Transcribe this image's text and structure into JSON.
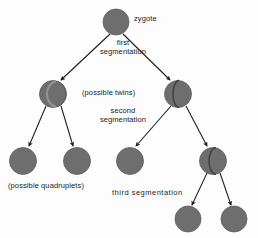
{
  "diagram": {
    "colors": {
      "cell_fill": "#6e6e6e",
      "cell_stroke": "#5a5a5a",
      "cell_cleft_light": "#8d8d8d",
      "cell_cleft_dark": "#4a4a4a",
      "arrow": "#1a1a1a",
      "text": "#1a1a1a",
      "background": "#fdfdfd"
    },
    "labels": {
      "zygote": "zygote",
      "first_segmentation": "first\nsegmentation",
      "first_segmentation_line1": "first",
      "first_segmentation_line2": "segmentation",
      "possible_twins": "(possible twins)",
      "second_segmentation_line1": "second",
      "second_segmentation_line2": "segmentation",
      "possible_quadruplets": "(possible quadruplets)",
      "third_segmentation": "third segmentation"
    },
    "nodes": [
      {
        "id": "zygote",
        "cx": 116,
        "cy": 22,
        "r": 13,
        "split": "none",
        "generation": 0
      },
      {
        "id": "twin-l",
        "cx": 53,
        "cy": 94,
        "r": 13.5,
        "split": "light",
        "generation": 1
      },
      {
        "id": "twin-r",
        "cx": 178,
        "cy": 94,
        "r": 13.5,
        "split": "dark",
        "generation": 1
      },
      {
        "id": "quad-1",
        "cx": 23,
        "cy": 161,
        "r": 13.5,
        "split": "none",
        "generation": 2
      },
      {
        "id": "quad-2",
        "cx": 77,
        "cy": 161,
        "r": 13.5,
        "split": "none",
        "generation": 2
      },
      {
        "id": "quad-3",
        "cx": 130,
        "cy": 161,
        "r": 13.5,
        "split": "none",
        "generation": 2
      },
      {
        "id": "quad-4",
        "cx": 213,
        "cy": 161,
        "r": 13.5,
        "split": "dark",
        "generation": 2
      },
      {
        "id": "oct-1",
        "cx": 188,
        "cy": 219,
        "r": 13,
        "split": "none",
        "generation": 3
      },
      {
        "id": "oct-2",
        "cx": 234,
        "cy": 219,
        "r": 13,
        "split": "none",
        "generation": 3
      }
    ],
    "edges": [
      {
        "from": "zygote",
        "to": "twin-l"
      },
      {
        "from": "zygote",
        "to": "twin-r"
      },
      {
        "from": "twin-l",
        "to": "quad-1"
      },
      {
        "from": "twin-l",
        "to": "quad-2"
      },
      {
        "from": "twin-r",
        "to": "quad-3"
      },
      {
        "from": "twin-r",
        "to": "quad-4"
      },
      {
        "from": "quad-4",
        "to": "oct-1"
      },
      {
        "from": "quad-4",
        "to": "oct-2"
      }
    ]
  }
}
